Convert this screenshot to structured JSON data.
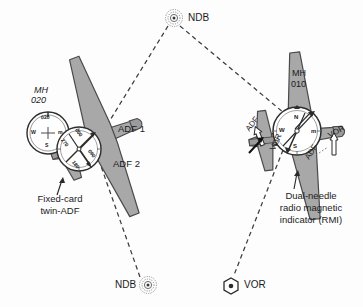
{
  "figure": {
    "background_color": "#fdfdfd",
    "ink_color": "#1b1b1b",
    "aircraft_fill": "#a8a8a8",
    "aircraft_stroke": "#4a4a4a",
    "instrument_fill": "#ffffff"
  },
  "navaids": [
    {
      "id": "ndb-top",
      "type": "ndb",
      "label": "NDB",
      "symbol": "concentric-rings",
      "label_side": "right"
    },
    {
      "id": "ndb-bottom",
      "type": "ndb",
      "label": "NDB",
      "symbol": "concentric-rings",
      "label_side": "left"
    },
    {
      "id": "vor-bottom",
      "type": "vor",
      "label": "VOR",
      "symbol": "hexagon-with-dot",
      "label_side": "right"
    }
  ],
  "aircraft": [
    {
      "id": "left-aircraft",
      "heading_prefix": "MH",
      "heading_value": "020",
      "caption_line1": "Fixed-card",
      "caption_line2": "twin-ADF",
      "instrument": "fixed-card twin-ADF",
      "bearing_labels": [
        {
          "id": "adf-1",
          "text": "ADF 1"
        },
        {
          "id": "adf-2",
          "text": "ADF 2"
        }
      ],
      "heading_indicator": {
        "top": "020",
        "left": "W",
        "bottom": "S",
        "right": "m"
      },
      "fixed_card": {
        "top": "000",
        "right": "090",
        "bottom": "180",
        "left": "270"
      }
    },
    {
      "id": "right-aircraft",
      "heading_prefix": "MH",
      "heading_value": "010",
      "caption_line1": "Dual-needle",
      "caption_line2": "radio magnetic",
      "caption_line3": "indicator (RMI)",
      "instrument": "dual-needle RMI",
      "rmi_card": {
        "top": "N",
        "right": "m",
        "bottom": "S",
        "left": "W"
      },
      "needle_labels": [
        {
          "id": "adf-needle-left",
          "text": "ADF"
        },
        {
          "id": "vor-needle-left",
          "text": "VOR"
        },
        {
          "id": "adf-needle-right",
          "text": "ADF"
        },
        {
          "id": "vor-needle-right",
          "text": "VOR"
        }
      ]
    }
  ],
  "bearing_lines": [
    {
      "id": "ndb-top-to-left-aircraft",
      "style": "dashed"
    },
    {
      "id": "ndb-top-to-right-aircraft",
      "style": "dashed"
    },
    {
      "id": "left-aircraft-to-ndb-bottom",
      "style": "dashed"
    },
    {
      "id": "right-aircraft-to-vor",
      "style": "dashed"
    }
  ]
}
